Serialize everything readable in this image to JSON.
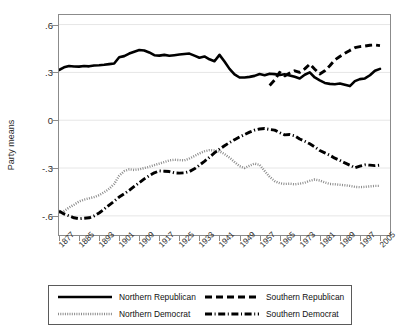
{
  "chart_data": {
    "type": "line",
    "title": "",
    "xlabel": "",
    "ylabel": "Party means",
    "ylim": [
      -0.72,
      0.66
    ],
    "xlim": [
      1877,
      2009
    ],
    "grid": "horizontal",
    "legend_position": "below",
    "ytick_labels": [
      ".6",
      ".3",
      "0",
      "-.3",
      "-.6"
    ],
    "ytick_values": [
      0.6,
      0.3,
      0,
      -0.3,
      -0.6
    ],
    "xtick_labels": [
      "1877",
      "1885",
      "1893",
      "1901",
      "1909",
      "1917",
      "1925",
      "1933",
      "1941",
      "1949",
      "1957",
      "1965",
      "1973",
      "1981",
      "1989",
      "1997",
      "2005"
    ],
    "xtick_values": [
      1877,
      1885,
      1893,
      1901,
      1909,
      1917,
      1925,
      1933,
      1941,
      1949,
      1957,
      1965,
      1973,
      1981,
      1989,
      1997,
      2005
    ],
    "x": [
      1877,
      1879,
      1881,
      1883,
      1885,
      1887,
      1889,
      1891,
      1893,
      1895,
      1897,
      1899,
      1901,
      1903,
      1905,
      1907,
      1909,
      1911,
      1913,
      1915,
      1917,
      1919,
      1921,
      1923,
      1925,
      1927,
      1929,
      1931,
      1933,
      1935,
      1937,
      1939,
      1941,
      1943,
      1945,
      1947,
      1949,
      1951,
      1953,
      1955,
      1957,
      1959,
      1961,
      1963,
      1965,
      1967,
      1969,
      1971,
      1973,
      1975,
      1977,
      1979,
      1981,
      1983,
      1985,
      1987,
      1989,
      1991,
      1993,
      1995,
      1997,
      1999,
      2001,
      2003,
      2005
    ],
    "series": [
      {
        "name": "Northern Republican",
        "style": "solid",
        "color": "#000000",
        "values": [
          0.315,
          0.332,
          0.34,
          0.337,
          0.336,
          0.34,
          0.338,
          0.343,
          0.345,
          0.348,
          0.352,
          0.356,
          0.395,
          0.402,
          0.418,
          0.43,
          0.44,
          0.437,
          0.425,
          0.408,
          0.405,
          0.41,
          0.404,
          0.408,
          0.412,
          0.415,
          0.418,
          0.405,
          0.392,
          0.4,
          0.382,
          0.37,
          0.41,
          0.368,
          0.322,
          0.288,
          0.268,
          0.268,
          0.272,
          0.278,
          0.29,
          0.282,
          0.292,
          0.289,
          0.284,
          0.288,
          0.281,
          0.272,
          0.262,
          0.285,
          0.3,
          0.268,
          0.25,
          0.234,
          0.228,
          0.226,
          0.23,
          0.222,
          0.214,
          0.245,
          0.258,
          0.262,
          0.282,
          0.31,
          0.322
        ]
      },
      {
        "name": "Southern Republican",
        "style": "dashed",
        "color": "#000000",
        "values": [
          null,
          null,
          null,
          null,
          null,
          null,
          null,
          null,
          null,
          null,
          null,
          null,
          null,
          null,
          null,
          null,
          null,
          null,
          null,
          null,
          null,
          null,
          null,
          null,
          null,
          null,
          null,
          null,
          null,
          null,
          null,
          null,
          null,
          null,
          null,
          null,
          null,
          null,
          null,
          null,
          null,
          null,
          0.218,
          0.252,
          0.3,
          0.278,
          0.296,
          0.31,
          0.3,
          0.322,
          0.352,
          0.32,
          0.29,
          0.31,
          0.342,
          0.378,
          0.4,
          0.42,
          0.438,
          0.455,
          0.462,
          0.465,
          0.47,
          0.472,
          0.468
        ]
      },
      {
        "name": "Northern Democrat",
        "style": "dotted",
        "color": "#8c8c8c",
        "values": [
          -0.582,
          -0.57,
          -0.548,
          -0.53,
          -0.51,
          -0.498,
          -0.49,
          -0.482,
          -0.47,
          -0.452,
          -0.43,
          -0.4,
          -0.348,
          -0.32,
          -0.308,
          -0.312,
          -0.308,
          -0.3,
          -0.292,
          -0.282,
          -0.272,
          -0.262,
          -0.252,
          -0.248,
          -0.25,
          -0.252,
          -0.24,
          -0.225,
          -0.208,
          -0.195,
          -0.188,
          -0.19,
          -0.195,
          -0.212,
          -0.235,
          -0.262,
          -0.288,
          -0.3,
          -0.285,
          -0.272,
          -0.28,
          -0.318,
          -0.355,
          -0.382,
          -0.395,
          -0.4,
          -0.398,
          -0.402,
          -0.398,
          -0.392,
          -0.38,
          -0.372,
          -0.378,
          -0.39,
          -0.4,
          -0.402,
          -0.405,
          -0.408,
          -0.412,
          -0.418,
          -0.42,
          -0.418,
          -0.415,
          -0.412,
          -0.412
        ]
      },
      {
        "name": "Southern Democrat",
        "style": "dashdot",
        "color": "#000000",
        "values": [
          -0.57,
          -0.588,
          -0.6,
          -0.612,
          -0.618,
          -0.615,
          -0.612,
          -0.6,
          -0.582,
          -0.558,
          -0.532,
          -0.508,
          -0.482,
          -0.462,
          -0.44,
          -0.415,
          -0.392,
          -0.368,
          -0.348,
          -0.33,
          -0.318,
          -0.32,
          -0.322,
          -0.33,
          -0.332,
          -0.33,
          -0.322,
          -0.305,
          -0.282,
          -0.258,
          -0.232,
          -0.205,
          -0.182,
          -0.16,
          -0.14,
          -0.122,
          -0.105,
          -0.09,
          -0.075,
          -0.062,
          -0.055,
          -0.052,
          -0.058,
          -0.062,
          -0.078,
          -0.092,
          -0.09,
          -0.098,
          -0.118,
          -0.132,
          -0.148,
          -0.168,
          -0.19,
          -0.205,
          -0.22,
          -0.238,
          -0.252,
          -0.268,
          -0.282,
          -0.298,
          -0.288,
          -0.28,
          -0.282,
          -0.285,
          -0.282
        ]
      }
    ]
  },
  "legend": {
    "items": [
      {
        "label": "Northern Republican",
        "style": "solid"
      },
      {
        "label": "Southern Republican",
        "style": "dashed"
      },
      {
        "label": "Northern Democrat",
        "style": "dotted"
      },
      {
        "label": "Southern Democrat",
        "style": "dashdot"
      }
    ]
  }
}
